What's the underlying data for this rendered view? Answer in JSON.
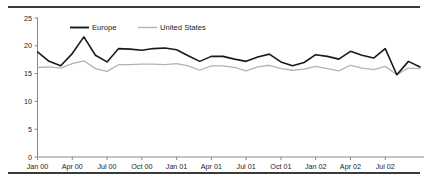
{
  "chart_data": {
    "type": "line",
    "title": "",
    "subtitle": "",
    "xlabel": "",
    "ylabel": "",
    "ylim": [
      0,
      25
    ],
    "yticks": [
      0,
      5,
      10,
      15,
      20,
      25
    ],
    "ytick_labels": [
      "0",
      "5",
      "10",
      "15",
      "20",
      "25"
    ],
    "grid": false,
    "legend_position": "top-center",
    "x": [
      "Jan 00",
      "Feb 00",
      "Mar 00",
      "Apr 00",
      "May 00",
      "Jun 00",
      "Jul 00",
      "Aug 00",
      "Sep 00",
      "Oct 00",
      "Nov 00",
      "Dec 00",
      "Jan 01",
      "Feb 01",
      "Mar 01",
      "Apr 01",
      "May 01",
      "Jun 01",
      "Jul 01",
      "Aug 01",
      "Sep 01",
      "Oct 01",
      "Nov 01",
      "Dec 01",
      "Jan 02",
      "Feb 02",
      "Mar 02",
      "Apr 02",
      "May 02",
      "Jun 02",
      "Jul 02",
      "Aug 02",
      "Sep 02",
      "Oct 02"
    ],
    "xtick_labels": [
      "Jan 00",
      "Apr 00",
      "Jul 00",
      "Oct 00",
      "Jan 01",
      "Apr 01",
      "Jul 01",
      "Oct 01",
      "Jan 02",
      "Apr 02",
      "Jul 02"
    ],
    "xtick_indices": [
      0,
      3,
      6,
      9,
      12,
      15,
      18,
      21,
      24,
      27,
      30
    ],
    "series": [
      {
        "name": "Europe",
        "color": "#1a1a1a",
        "width": 1.6,
        "values": [
          18.9,
          17.2,
          16.4,
          18.6,
          21.6,
          18.3,
          17.1,
          19.5,
          19.4,
          19.2,
          19.5,
          19.6,
          19.3,
          18.2,
          17.2,
          18.1,
          18.1,
          17.6,
          17.2,
          18.0,
          18.5,
          17.1,
          16.4,
          17.0,
          18.4,
          18.1,
          17.6,
          19.0,
          18.3,
          17.8,
          19.5,
          14.8,
          17.2,
          16.2
        ]
      },
      {
        "name": "United States",
        "color": "#b3b3b3",
        "width": 1.3,
        "values": [
          16.1,
          16.2,
          16.0,
          16.8,
          17.3,
          15.9,
          15.4,
          16.6,
          16.6,
          16.7,
          16.7,
          16.6,
          16.8,
          16.4,
          15.6,
          16.4,
          16.4,
          16.1,
          15.5,
          16.2,
          16.5,
          15.9,
          15.6,
          15.8,
          16.3,
          15.9,
          15.5,
          16.5,
          16.0,
          15.7,
          16.3,
          14.8,
          16.0,
          15.9
        ]
      }
    ],
    "legend": [
      {
        "label": "Europe",
        "color": "#1a1a1a"
      },
      {
        "label": "United States",
        "color": "#b3b3b3"
      }
    ]
  },
  "figure": {
    "background": "#ffffff",
    "axis_color": "#888888",
    "text_color": "#1c1c1c",
    "rule_color": "#3a3a3a"
  }
}
